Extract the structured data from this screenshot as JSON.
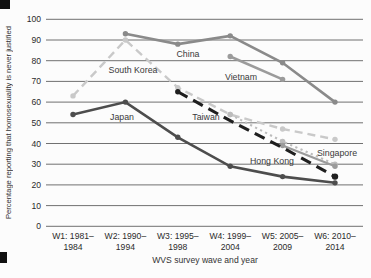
{
  "chart_data": {
    "type": "line",
    "title": "",
    "xlabel": "WVS survey wave and year",
    "ylabel": "Percentage reporting that homosexuality is never justified",
    "ylim": [
      0,
      100
    ],
    "grid": true,
    "legend_position": "none (series labeled inline on plot)",
    "yticks": [
      0,
      10,
      20,
      30,
      40,
      50,
      60,
      70,
      80,
      90,
      100
    ],
    "categories": [
      "W1: 1981–1984",
      "W2: 1990–1994",
      "W3: 1995–1998",
      "W4: 1999–2004",
      "W5: 2005–2009",
      "W6: 2010–2014"
    ],
    "categories_lines": [
      {
        "top": "W1: 1981–",
        "bottom": "1984"
      },
      {
        "top": "W2: 1990–",
        "bottom": "1994"
      },
      {
        "top": "W3: 1995–",
        "bottom": "1998"
      },
      {
        "top": "W4: 1999–",
        "bottom": "2004"
      },
      {
        "top": "W5: 2005–",
        "bottom": "2009"
      },
      {
        "top": "W6: 2010–",
        "bottom": "2014"
      }
    ],
    "series": [
      {
        "name": "South Korea",
        "values": [
          63,
          90,
          67,
          54,
          47,
          42
        ],
        "color": "#c9c9c9",
        "style": "dashed"
      },
      {
        "name": "Singapore",
        "values": [
          null,
          null,
          null,
          54,
          41,
          30
        ],
        "color": "#bcbcbc",
        "style": "dotted"
      },
      {
        "name": "Hong Kong",
        "values": [
          null,
          null,
          null,
          null,
          39,
          29
        ],
        "color": "#9b9b9b",
        "style": "solid-thin"
      },
      {
        "name": "Vietnam",
        "values": [
          null,
          null,
          null,
          82,
          71,
          null
        ],
        "color": "#9b9b9b",
        "style": "solid"
      },
      {
        "name": "China",
        "values": [
          null,
          93,
          88,
          92,
          79,
          60
        ],
        "color": "#8a8a8a",
        "style": "solid"
      },
      {
        "name": "Japan",
        "values": [
          54,
          60,
          43,
          29,
          24,
          21
        ],
        "color": "#4d4d4d",
        "style": "solid"
      },
      {
        "name": "Taiwan",
        "values": [
          null,
          null,
          65,
          51,
          38,
          24
        ],
        "color": "#1f1f1f",
        "style": "dashed-bold"
      }
    ],
    "labels": [
      {
        "text": "China",
        "x": 188,
        "y": 57
      },
      {
        "text": "South Korea",
        "x": 133,
        "y": 73
      },
      {
        "text": "Vietnam",
        "x": 241,
        "y": 80
      },
      {
        "text": "Japan",
        "x": 122,
        "y": 120
      },
      {
        "text": "Taiwan",
        "x": 206,
        "y": 120
      },
      {
        "text": "Hong Kong",
        "x": 272,
        "y": 164
      },
      {
        "text": "Singapore",
        "x": 337,
        "y": 156
      }
    ]
  }
}
